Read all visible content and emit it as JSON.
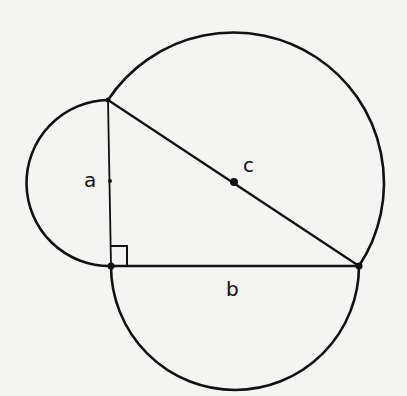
{
  "diagram": {
    "labels": {
      "a": "a",
      "b": "b",
      "c": "c"
    },
    "colors": {
      "background": "#f4f4f2",
      "stroke": "#111111"
    },
    "vertices": {
      "top": [
        108,
        100
      ],
      "right_angle": [
        111,
        266
      ],
      "right": [
        359,
        266
      ]
    },
    "semicircles": [
      {
        "side": "a",
        "center": [
          110,
          183
        ],
        "radius": 83
      },
      {
        "side": "b",
        "center": [
          235,
          266
        ],
        "radius": 124
      },
      {
        "side": "c",
        "center": [
          234,
          183
        ],
        "radius": 150
      }
    ]
  }
}
